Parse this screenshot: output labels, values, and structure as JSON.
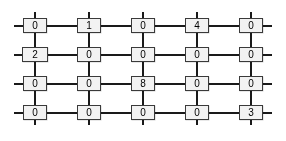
{
  "figure": {
    "colors": {
      "background": "#ffffff",
      "line": "#2b2b2b",
      "box_border": "#3a3a3a",
      "box_fill": "#f2f2f2",
      "text": "#000000"
    },
    "grid": {
      "rows": 4,
      "cols": 5,
      "values": [
        [
          "0",
          "1",
          "0",
          "4",
          "0"
        ],
        [
          "2",
          "0",
          "0",
          "0",
          "0"
        ],
        [
          "0",
          "0",
          "8",
          "0",
          "0"
        ],
        [
          "0",
          "0",
          "0",
          "0",
          "3"
        ]
      ]
    }
  }
}
